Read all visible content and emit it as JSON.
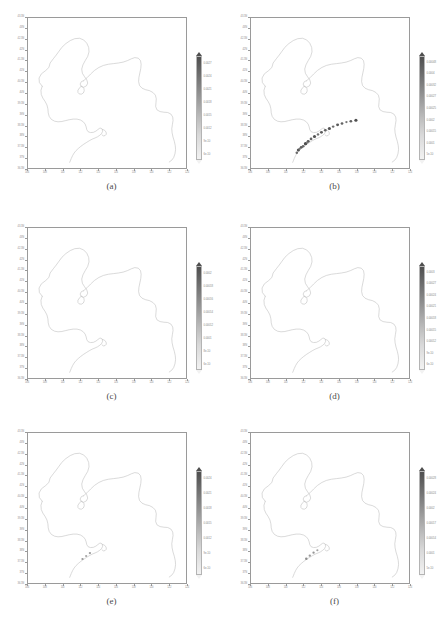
{
  "figure": {
    "layout": "2 columns x 3 rows",
    "background_color": "#ffffff",
    "boundary_color": "#b9b9b9",
    "frame_color": "#9a9a9a",
    "text_color": "#8d8d8d"
  },
  "axes": {
    "x_tick_labels": [
      "106",
      "108",
      "110",
      "112",
      "114",
      "116",
      "118",
      "120",
      "122",
      "124"
    ],
    "y_tick_labels": [
      "43.5N",
      "43N",
      "42.5N",
      "42N",
      "41.5N",
      "41N",
      "40.5N",
      "40N",
      "39.5N",
      "39N",
      "38.5N",
      "38N",
      "37.5N",
      "37N",
      "36.5N"
    ],
    "x_label": "",
    "y_label": ""
  },
  "colorbar_style": {
    "orientation": "vertical",
    "colormap": "grayscale",
    "top_color": "#4f4f4f",
    "bottom_color": "#f2f2f2",
    "has_triangular_caps": true
  },
  "panels": [
    {
      "id": "a",
      "caption": "(a)",
      "markers": [],
      "colorbar_labels": [
        "0.0027",
        "0.0024",
        "0.0021",
        "0.0018",
        "0.0015",
        "0.0012",
        "9e-10",
        "6e-10"
      ]
    },
    {
      "id": "b",
      "caption": "(b)",
      "markers": [
        {
          "x": 0.3,
          "y": 0.88,
          "size": 1.6,
          "color": "#555555"
        },
        {
          "x": 0.318,
          "y": 0.862,
          "size": 1.5,
          "color": "#5f5f5f"
        },
        {
          "x": 0.33,
          "y": 0.855,
          "size": 1.4,
          "color": "#6a6a6a"
        },
        {
          "x": 0.345,
          "y": 0.838,
          "size": 1.7,
          "color": "#4e4e4e"
        },
        {
          "x": 0.362,
          "y": 0.822,
          "size": 1.5,
          "color": "#5a5a5a"
        },
        {
          "x": 0.38,
          "y": 0.806,
          "size": 1.4,
          "color": "#666666"
        },
        {
          "x": 0.402,
          "y": 0.79,
          "size": 1.6,
          "color": "#525252"
        },
        {
          "x": 0.424,
          "y": 0.776,
          "size": 1.3,
          "color": "#707070"
        },
        {
          "x": 0.446,
          "y": 0.762,
          "size": 1.5,
          "color": "#5c5c5c"
        },
        {
          "x": 0.47,
          "y": 0.748,
          "size": 1.4,
          "color": "#646464"
        },
        {
          "x": 0.496,
          "y": 0.736,
          "size": 1.6,
          "color": "#545454"
        },
        {
          "x": 0.52,
          "y": 0.724,
          "size": 1.3,
          "color": "#6e6e6e"
        },
        {
          "x": 0.548,
          "y": 0.712,
          "size": 1.5,
          "color": "#5a5a5a"
        },
        {
          "x": 0.576,
          "y": 0.703,
          "size": 1.4,
          "color": "#636363"
        },
        {
          "x": 0.604,
          "y": 0.694,
          "size": 1.2,
          "color": "#787878"
        },
        {
          "x": 0.632,
          "y": 0.688,
          "size": 1.4,
          "color": "#606060"
        },
        {
          "x": 0.664,
          "y": 0.682,
          "size": 1.6,
          "color": "#4f4f4f"
        },
        {
          "x": 0.29,
          "y": 0.898,
          "size": 1.3,
          "color": "#6c6c6c"
        },
        {
          "x": 0.308,
          "y": 0.872,
          "size": 1.2,
          "color": "#757575"
        },
        {
          "x": 0.356,
          "y": 0.83,
          "size": 1.2,
          "color": "#787878"
        }
      ],
      "colorbar_labels": [
        "0.00048",
        "0.0004",
        "0.00032",
        "0.00027",
        "0.00025",
        "0.0002",
        "0.00015",
        "0.0001",
        "5e-10"
      ]
    },
    {
      "id": "c",
      "caption": "(c)",
      "markers": [],
      "colorbar_labels": [
        "0.0002",
        "0.00018",
        "0.00016",
        "0.00014",
        "0.00012",
        "0.0001",
        "8e-10",
        "6e-10"
      ]
    },
    {
      "id": "d",
      "caption": "(d)",
      "markers": [],
      "colorbar_labels": [
        "0.0003",
        "0.00027",
        "0.00024",
        "0.00021",
        "0.00018",
        "0.00015",
        "0.00012",
        "9e-10",
        "6e-10"
      ]
    },
    {
      "id": "e",
      "caption": "(e)",
      "markers": [
        {
          "x": 0.345,
          "y": 0.84,
          "size": 1.2,
          "color": "#9a9a9a"
        },
        {
          "x": 0.368,
          "y": 0.82,
          "size": 1.1,
          "color": "#a4a4a4"
        },
        {
          "x": 0.392,
          "y": 0.8,
          "size": 1.2,
          "color": "#9e9e9e"
        }
      ],
      "colorbar_labels": [
        "0.0024",
        "0.0021",
        "0.0018",
        "0.0015",
        "0.0012",
        "9e-10",
        "6e-10"
      ]
    },
    {
      "id": "f",
      "caption": "(f)",
      "markers": [
        {
          "x": 0.35,
          "y": 0.838,
          "size": 1.3,
          "color": "#8f8f8f"
        },
        {
          "x": 0.372,
          "y": 0.818,
          "size": 1.2,
          "color": "#9a9a9a"
        },
        {
          "x": 0.396,
          "y": 0.798,
          "size": 1.2,
          "color": "#959595"
        },
        {
          "x": 0.42,
          "y": 0.782,
          "size": 1.1,
          "color": "#a2a2a2"
        }
      ],
      "colorbar_labels": [
        "0.00028",
        "0.00024",
        "0.0002",
        "0.00017",
        "0.00014",
        "0.0001",
        "5e-10"
      ]
    }
  ]
}
